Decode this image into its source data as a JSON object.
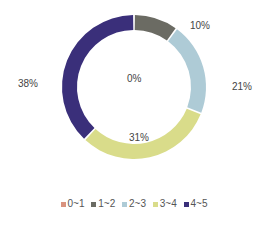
{
  "chart_data": {
    "type": "pie",
    "variant": "donut",
    "title": "",
    "categories": [
      "0~1",
      "1~2",
      "2~3",
      "3~4",
      "4~5"
    ],
    "values": [
      0,
      10,
      21,
      31,
      38
    ],
    "labels": [
      "0%",
      "10%",
      "21%",
      "31%",
      "38%"
    ],
    "colors": [
      "#d9937f",
      "#6b6b63",
      "#aecbd6",
      "#d9dc8a",
      "#3a2f7a"
    ],
    "legend_position": "bottom",
    "start_angle_deg": 0,
    "direction": "clockwise"
  },
  "labels": {
    "l0": "0%",
    "l1": "10%",
    "l2": "21%",
    "l3": "31%",
    "l4": "38%"
  },
  "legend": [
    {
      "label": "0~1",
      "color": "#d9937f"
    },
    {
      "label": "1~2",
      "color": "#6b6b63"
    },
    {
      "label": "2~3",
      "color": "#aecbd6"
    },
    {
      "label": "3~4",
      "color": "#d9dc8a"
    },
    {
      "label": "4~5",
      "color": "#3a2f7a"
    }
  ]
}
